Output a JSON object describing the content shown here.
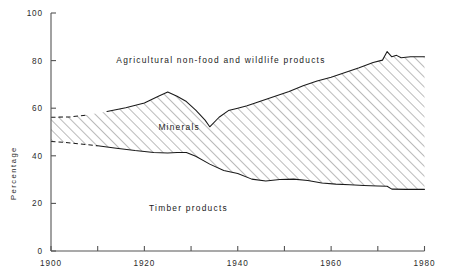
{
  "chart_data": {
    "type": "area",
    "title": "",
    "subtitle": "",
    "xlabel": "",
    "ylabel": "Percentage",
    "xlim": [
      1900,
      1980
    ],
    "ylim": [
      0,
      100
    ],
    "xticks": [
      1900,
      1910,
      1920,
      1930,
      1940,
      1950,
      1960,
      1970,
      1980
    ],
    "xtick_labels": [
      "1900",
      "",
      "1920",
      "",
      "1940",
      "",
      "1960",
      "",
      "1980"
    ],
    "yticks": [
      0,
      20,
      40,
      60,
      80,
      100
    ],
    "ytick_labels": [
      "0",
      "20",
      "40",
      "60",
      "80",
      "100"
    ],
    "grid": false,
    "legend_position": "inline-annotations",
    "stacked": true,
    "annotations": [
      {
        "text": "Agricultural non-food and wildlife products",
        "x": 1914,
        "y": 79,
        "name": "agricultural-band-label"
      },
      {
        "text": "Minerals",
        "x": 1923,
        "y": 51,
        "name": "minerals-band-label"
      },
      {
        "text": "Timber products",
        "x": 1921,
        "y": 17,
        "name": "timber-band-label"
      }
    ],
    "x": [
      1900,
      1905,
      1910,
      1915,
      1920,
      1925,
      1930,
      1935,
      1940,
      1945,
      1950,
      1955,
      1960,
      1965,
      1970,
      1973,
      1975,
      1980
    ],
    "series": [
      {
        "name": "Timber products",
        "fill": "none",
        "cumulative_upper_bound_label": "top-of-timber",
        "values": [
          46,
          45,
          44,
          43,
          42,
          41,
          40,
          37,
          33,
          30,
          29,
          28.5,
          28,
          27.5,
          27,
          26,
          26,
          26
        ]
      },
      {
        "name": "Minerals",
        "fill": "diagonal-hatch",
        "cumulative_upper_bound_label": "top-of-minerals",
        "values": [
          10,
          12,
          14,
          17,
          20,
          26,
          21,
          15,
          27,
          32,
          36,
          40,
          44,
          49,
          54,
          58,
          56,
          56
        ]
      },
      {
        "name": "Agricultural non-food and wildlife products",
        "fill": "none",
        "cumulative_upper_bound_label": "100-percent",
        "values": [
          44,
          43,
          42,
          40,
          38,
          33,
          39,
          48,
          40,
          38,
          35,
          31.5,
          28,
          23.5,
          19,
          16,
          18,
          18
        ]
      }
    ],
    "boundary_curves": {
      "top_of_timber": {
        "note": "lower boundary of hatched Minerals band; dashed for 1900-1910 (estimated)",
        "points": [
          [
            1900,
            46
          ],
          [
            1903,
            45.6
          ],
          [
            1906,
            45
          ],
          [
            1910,
            44.2
          ],
          [
            1914,
            43.2
          ],
          [
            1918,
            42.2
          ],
          [
            1922,
            41.4
          ],
          [
            1925,
            41.2
          ],
          [
            1927,
            41.4
          ],
          [
            1929,
            41.4
          ],
          [
            1931,
            39.8
          ],
          [
            1934,
            36.5
          ],
          [
            1937,
            33.8
          ],
          [
            1940,
            32.6
          ],
          [
            1943,
            30.2
          ],
          [
            1946,
            29.4
          ],
          [
            1949,
            30.0
          ],
          [
            1952,
            30.2
          ],
          [
            1955,
            29.6
          ],
          [
            1958,
            28.6
          ],
          [
            1961,
            28.1
          ],
          [
            1964,
            27.8
          ],
          [
            1967,
            27.5
          ],
          [
            1970,
            27.3
          ],
          [
            1972,
            27.2
          ],
          [
            1973,
            26.0
          ],
          [
            1976,
            25.9
          ],
          [
            1980,
            25.9
          ]
        ],
        "dashed_span": [
          1900,
          1910
        ]
      },
      "top_of_minerals": {
        "note": "upper boundary of hatched Minerals band; dashed for 1900-1910 (estimated)",
        "points": [
          [
            1900,
            56.2
          ],
          [
            1904,
            56.3
          ],
          [
            1908,
            57.2
          ],
          [
            1912,
            58.6
          ],
          [
            1916,
            60.2
          ],
          [
            1920,
            62.2
          ],
          [
            1923,
            65.0
          ],
          [
            1925,
            66.8
          ],
          [
            1927,
            65.0
          ],
          [
            1929,
            62.8
          ],
          [
            1931,
            59.2
          ],
          [
            1933,
            55.0
          ],
          [
            1934,
            52.2
          ],
          [
            1936,
            56.2
          ],
          [
            1938,
            59.0
          ],
          [
            1940,
            60.0
          ],
          [
            1942,
            61.0
          ],
          [
            1945,
            63.0
          ],
          [
            1948,
            65.0
          ],
          [
            1951,
            67.0
          ],
          [
            1954,
            69.4
          ],
          [
            1957,
            71.4
          ],
          [
            1960,
            73.0
          ],
          [
            1963,
            75.0
          ],
          [
            1966,
            77.0
          ],
          [
            1969,
            79.2
          ],
          [
            1971,
            80.2
          ],
          [
            1972,
            83.8
          ],
          [
            1973,
            81.6
          ],
          [
            1974,
            82.2
          ],
          [
            1975,
            81.2
          ],
          [
            1977,
            81.6
          ],
          [
            1980,
            81.6
          ]
        ],
        "dashed_span": [
          1900,
          1910
        ]
      }
    },
    "colors": {
      "background": "#ffffff",
      "axis": "#545454",
      "curve": "#1a1a1a",
      "hatch": "#4a4a4a",
      "text": "#2b2b2b"
    }
  }
}
